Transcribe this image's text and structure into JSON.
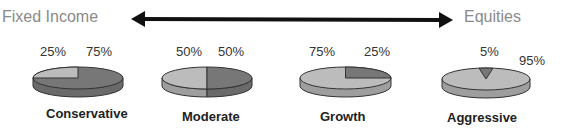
{
  "axis": {
    "left_label": "Fixed Income",
    "right_label": "Equities"
  },
  "colors": {
    "fixed_income_top": "#777777",
    "fixed_income_side": "#6a6a6a",
    "equities_top": "#bcbcbc",
    "equities_side": "#9e9e9e",
    "outline": "#333333",
    "arrow": "#111111"
  },
  "portfolios": [
    {
      "name": "Conservative",
      "equities_pct": 25,
      "fixed_income_pct": 75,
      "label_left": "25%",
      "label_right": "75%"
    },
    {
      "name": "Moderate",
      "equities_pct": 50,
      "fixed_income_pct": 50,
      "label_left": "50%",
      "label_right": "50%"
    },
    {
      "name": "Growth",
      "equities_pct": 75,
      "fixed_income_pct": 25,
      "label_left": "75%",
      "label_right": "25%"
    },
    {
      "name": "Aggressive",
      "equities_pct": 95,
      "fixed_income_pct": 5,
      "label_left": "5%",
      "label_right": "95%"
    }
  ]
}
